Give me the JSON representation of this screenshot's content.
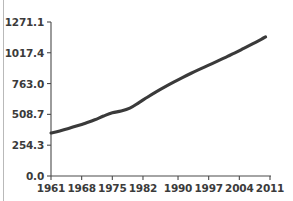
{
  "chart_data": {
    "type": "line",
    "title": "",
    "subtitle": "",
    "xlabel": "",
    "ylabel": "",
    "grid": false,
    "legend": null,
    "legend_position": "none",
    "line_color": "#3a3a3a",
    "axis_color": "#4a4a4a",
    "background_color": "#ffffff",
    "xlim": [
      1961,
      2011
    ],
    "ylim": [
      0.0,
      1271.1
    ],
    "xticks": [
      1961,
      1968,
      1975,
      1982,
      1990,
      1997,
      2004,
      2011
    ],
    "xtick_labels": [
      "1961",
      "1968",
      "1975",
      "1982",
      "1990",
      "1997",
      "2004",
      "2011"
    ],
    "yticks": [
      0.0,
      254.3,
      508.7,
      763.0,
      1017.4,
      1271.1
    ],
    "ytick_labels": [
      "0.0",
      "254.3",
      "508.7",
      "763.0",
      "1017.4",
      "1271.1"
    ],
    "series": [
      {
        "name": "series-1",
        "x": [
          1961,
          1963,
          1965,
          1967,
          1969,
          1971,
          1973,
          1975,
          1977,
          1979,
          1981,
          1983,
          1985,
          1987,
          1989,
          1991,
          1993,
          1995,
          1997,
          1999,
          2001,
          2003,
          2005,
          2007,
          2009,
          2010
        ],
        "values": [
          355,
          372,
          392,
          414,
          438,
          464,
          495,
          522,
          536,
          560,
          604,
          650,
          694,
          735,
          774,
          812,
          848,
          882,
          915,
          948,
          982,
          1016,
          1053,
          1090,
          1128,
          1148
        ]
      }
    ]
  }
}
